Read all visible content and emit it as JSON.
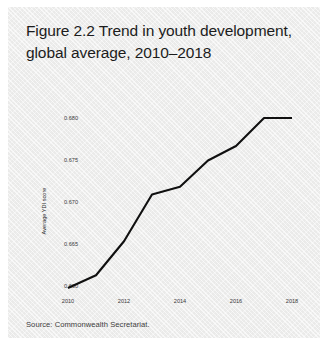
{
  "figure": {
    "title": "Figure 2.2  Trend in youth development, global average, 2010–2018",
    "source_note": "Source: Commonwealth Secretariat."
  },
  "colors": {
    "panel_background": "#f1f1f0",
    "line": "#101010",
    "title_text": "#1c1c1c",
    "tick_text": "#3a3a3a",
    "source_text": "#3c3c3c"
  },
  "chart_data": {
    "type": "line",
    "title": "Figure 2.2  Trend in youth development, global average, 2010–2018",
    "xlabel": "",
    "ylabel": "Average YDI score",
    "x": [
      2010,
      2011,
      2012,
      2013,
      2014,
      2015,
      2016,
      2017,
      2018
    ],
    "series": [
      {
        "name": "Average YDI score",
        "values": [
          0.66,
          0.6615,
          0.6655,
          0.671,
          0.6719,
          0.675,
          0.6767,
          0.68,
          0.68
        ]
      }
    ],
    "xlim": [
      2010,
      2018
    ],
    "ylim": [
      0.6595,
      0.6805
    ],
    "xticks": [
      2010,
      2012,
      2014,
      2016,
      2018
    ],
    "xtick_labels": [
      "2010",
      "2012",
      "2014",
      "2016",
      "2018"
    ],
    "yticks": [
      0.66,
      0.665,
      0.67,
      0.675,
      0.68
    ],
    "ytick_labels": [
      "0.660",
      "0.665",
      "0.670",
      "0.675",
      "0.680"
    ],
    "grid": false,
    "legend": false,
    "legend_position": "none"
  }
}
